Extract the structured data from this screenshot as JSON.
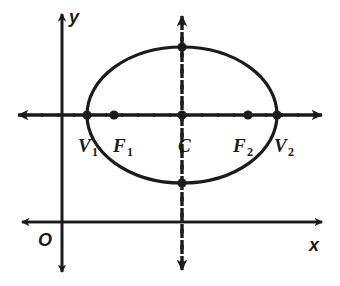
{
  "figure": {
    "kind": "ellipse-diagram",
    "background_color": "#ffffff",
    "stroke_color": "#1b1b1b",
    "axes": {
      "x_axis_label": "x",
      "y_axis_label": "y",
      "origin_label": "O",
      "x_axis_y": 222,
      "y_axis_x": 62,
      "x_axis_from": 22,
      "x_axis_to": 322,
      "y_axis_from": 272,
      "y_axis_to": 14
    },
    "ellipse": {
      "center_x": 182,
      "center_y": 115,
      "semi_major": 95,
      "semi_minor": 68,
      "stroke_width": 3
    },
    "major_axis_line": {
      "style": "dashed",
      "y": 115,
      "from_x": 18,
      "to_x": 322,
      "arrow_left": true,
      "arrow_right": true
    },
    "minor_axis_line": {
      "style": "dashed",
      "x": 182,
      "from_y": 14,
      "to_y": 270,
      "arrow_up": true,
      "arrow_down": true
    },
    "points": [
      {
        "id": "V1",
        "label": "V",
        "subscript": "1",
        "cx": 87,
        "cy": 115,
        "label_x": 78,
        "label_y": 136
      },
      {
        "id": "F1",
        "label": "F",
        "subscript": "1",
        "cx": 114,
        "cy": 115,
        "label_x": 113,
        "label_y": 136
      },
      {
        "id": "C",
        "label": "C",
        "subscript": "",
        "cx": 182,
        "cy": 115,
        "label_x": 178,
        "label_y": 136
      },
      {
        "id": "F2",
        "label": "F",
        "subscript": "2",
        "cx": 248,
        "cy": 115,
        "label_x": 233,
        "label_y": 136
      },
      {
        "id": "V2",
        "label": "V",
        "subscript": "2",
        "cx": 277,
        "cy": 115,
        "label_x": 274,
        "label_y": 136
      },
      {
        "id": "TOP",
        "label": "",
        "subscript": "",
        "cx": 182,
        "cy": 47,
        "label_x": 0,
        "label_y": 0
      },
      {
        "id": "BOT",
        "label": "",
        "subscript": "",
        "cx": 182,
        "cy": 183,
        "label_x": 0,
        "label_y": 0
      }
    ],
    "label_positions": {
      "x_label_x": 309,
      "x_label_y": 236,
      "y_label_x": 69,
      "y_label_y": 8,
      "origin_label_x": 38,
      "origin_label_y": 231
    }
  }
}
